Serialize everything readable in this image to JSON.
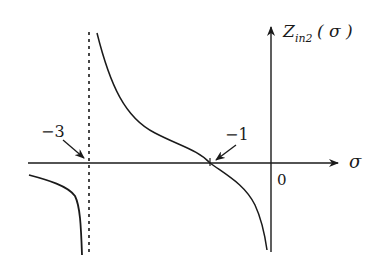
{
  "diagram": {
    "type": "function-plot",
    "y_axis_label": "Z",
    "y_axis_label_subscript": "in2",
    "y_axis_label_arg": "( σ )",
    "x_axis_label": "σ",
    "origin_label": "0",
    "annotations": [
      {
        "text": "−3",
        "meaning": "vertical asymptote at σ = −3"
      },
      {
        "text": "−1",
        "meaning": "zero crossing at σ = −1"
      }
    ],
    "asymptote": {
      "x": -3,
      "style": "dashed"
    },
    "colors": {
      "line": "#1a1a1a",
      "background": "#ffffff"
    }
  }
}
